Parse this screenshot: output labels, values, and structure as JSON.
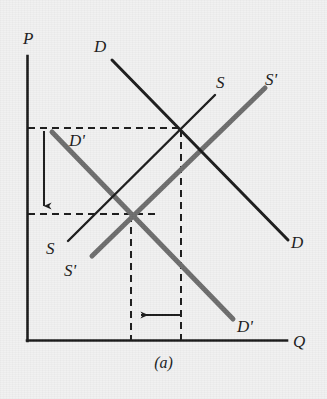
{
  "figure": {
    "caption": "(a)",
    "background_color": "#f1f1f1",
    "ink_color": "#1b1b1b",
    "shifted_curve_color": "#6d6d6d"
  },
  "axes": {
    "y_label": "P",
    "x_label": "Q",
    "origin": [
      27,
      341
    ],
    "y_top": [
      27,
      56
    ],
    "x_right": [
      287,
      341
    ]
  },
  "curves": [
    {
      "id": "demand-original",
      "label": "D",
      "role": "original-demand",
      "color": "#1b1b1b",
      "width": 3,
      "start": [
        112,
        60
      ],
      "end": [
        288,
        240
      ],
      "label_start_pos": [
        96,
        39
      ],
      "label_end_pos": [
        292,
        234
      ]
    },
    {
      "id": "supply-original",
      "label": "S",
      "role": "original-supply",
      "color": "#1b1b1b",
      "width": 2.4,
      "start": [
        68,
        241
      ],
      "end": [
        215,
        95
      ],
      "label_start_pos": [
        48,
        240
      ],
      "label_end_pos": [
        217,
        75
      ]
    },
    {
      "id": "demand-shifted",
      "label": "D'",
      "role": "shifted-demand",
      "color": "#6d6d6d",
      "width": 5,
      "start": [
        52,
        132
      ],
      "end": [
        233,
        319
      ],
      "label_start_pos": [
        71,
        132
      ],
      "label_end_pos": [
        238,
        320
      ]
    },
    {
      "id": "supply-shifted",
      "label": "S'",
      "role": "shifted-supply",
      "color": "#6d6d6d",
      "width": 5,
      "start": [
        92,
        256
      ],
      "end": [
        265,
        88
      ],
      "label_start_pos": [
        66,
        262
      ],
      "label_end_pos": [
        266,
        72
      ]
    }
  ],
  "equilibria": [
    {
      "id": "equilibrium-initial",
      "point": [
        181,
        129
      ],
      "note": "D x S"
    },
    {
      "id": "equilibrium-new",
      "point": [
        131,
        214
      ],
      "note": "D-prime x S-prime"
    }
  ],
  "guide_lines": [
    {
      "id": "price-high-guide",
      "orientation": "horizontal",
      "from": [
        28,
        128
      ],
      "to": [
        182,
        128
      ]
    },
    {
      "id": "price-low-guide",
      "orientation": "horizontal",
      "from": [
        28,
        214
      ],
      "to": [
        160,
        214
      ]
    },
    {
      "id": "quantity-high-guide",
      "orientation": "vertical",
      "from": [
        181,
        130
      ],
      "to": [
        181,
        340
      ]
    },
    {
      "id": "quantity-low-guide",
      "orientation": "vertical",
      "from": [
        131,
        215
      ],
      "to": [
        131,
        340
      ]
    }
  ],
  "arrows": [
    {
      "id": "price-fall-arrow",
      "direction": "down",
      "meaning": "price decreases",
      "from": [
        44,
        131
      ],
      "to": [
        44,
        212
      ]
    },
    {
      "id": "quantity-fall-arrow",
      "direction": "left",
      "meaning": "quantity decreases",
      "from": [
        180,
        315
      ],
      "to": [
        134,
        315
      ]
    }
  ],
  "caption_pos": [
    163,
    360
  ]
}
